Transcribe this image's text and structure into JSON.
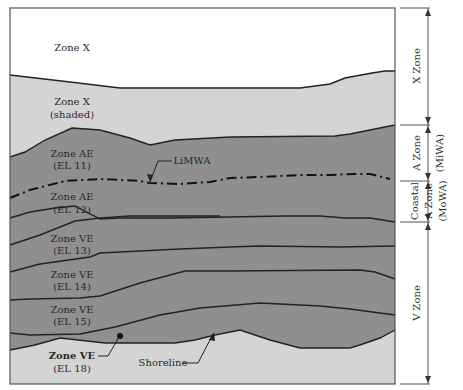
{
  "diagram": {
    "type": "flood-zone-cross-section",
    "colors": {
      "zone_x_unshaded": "#ffffff",
      "zone_x_shaded": "#d4d4d4",
      "zone_a_v": "#8f8f8f",
      "lines": "#222222",
      "frame": "#555555"
    },
    "zones": [
      {
        "line1": "Zone X",
        "line2": ""
      },
      {
        "line1": "Zone X",
        "line2": "(shaded)"
      },
      {
        "line1": "Zone AE",
        "line2": "(EL 11)"
      },
      {
        "line1": "Zone AE",
        "line2": "(EL 12)"
      },
      {
        "line1": "Zone VE",
        "line2": "(EL 13)"
      },
      {
        "line1": "Zone VE",
        "line2": "(EL 14)"
      },
      {
        "line1": "Zone VE",
        "line2": "(EL 15)"
      },
      {
        "line1": "Zone VE",
        "line2": "(EL 18)"
      }
    ],
    "callouts": {
      "limwa": "LiMWA",
      "shoreline": "Shoreline"
    },
    "brackets": [
      {
        "line1": "X Zone",
        "line2": ""
      },
      {
        "line1": "A Zone",
        "line2": "(MiWA)"
      },
      {
        "line1": "Coastal",
        "line2": "A Zone",
        "line3": "(MoWA)"
      },
      {
        "line1": "V Zone",
        "line2": ""
      }
    ]
  }
}
